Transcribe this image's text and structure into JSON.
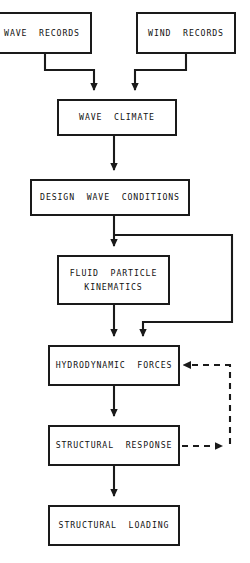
{
  "diagram": {
    "type": "flowchart",
    "colors": {
      "background": "#ffffff",
      "stroke": "#1a1a1a",
      "text": "#111111"
    },
    "nodes": [
      {
        "id": "wave-records",
        "label": "WAVE  RECORDS",
        "line1": "WAVE  RECORDS",
        "x": -8,
        "y": 12,
        "width": 100,
        "height": 42
      },
      {
        "id": "wind-records",
        "label": "WIND  RECORDS",
        "line1": "WIND  RECORDS",
        "x": 136,
        "y": 12,
        "width": 100,
        "height": 42
      },
      {
        "id": "wave-climate",
        "label": "WAVE  CLIMATE",
        "line1": "WAVE  CLIMATE",
        "x": 57,
        "y": 99,
        "width": 120,
        "height": 37
      },
      {
        "id": "design-wave-conditions",
        "label": "DESIGN  WAVE  CONDITIONS",
        "line1": "DESIGN  WAVE  CONDITIONS",
        "x": 30,
        "y": 179,
        "width": 160,
        "height": 37
      },
      {
        "id": "fluid-particle-kinematics",
        "label": "FLUID  PARTICLE KINEMATICS",
        "line1": "FLUID  PARTICLE",
        "line2": "KINEMATICS",
        "x": 57,
        "y": 255,
        "width": 113,
        "height": 50
      },
      {
        "id": "hydrodynamic-forces",
        "label": "HYDRODYNAMIC  FORCES",
        "line1": "HYDRODYNAMIC  FORCES",
        "x": 48,
        "y": 345,
        "width": 132,
        "height": 41
      },
      {
        "id": "structural-response",
        "label": "STRUCTURAL  RESPONSE",
        "line1": "STRUCTURAL  RESPONSE",
        "x": 48,
        "y": 425,
        "width": 132,
        "height": 41
      },
      {
        "id": "structural-loading",
        "label": "STRUCTURAL  LOADING",
        "line1": "STRUCTURAL  LOADING",
        "x": 48,
        "y": 505,
        "width": 132,
        "height": 41
      }
    ],
    "edges": [
      {
        "id": "wave-records-to-wave-climate",
        "from": "wave-records",
        "to": "wave-climate",
        "style": "solid",
        "arrow": "end"
      },
      {
        "id": "wind-records-to-wave-climate",
        "from": "wind-records",
        "to": "wave-climate",
        "style": "solid",
        "arrow": "end"
      },
      {
        "id": "wave-climate-to-design-wave-conditions",
        "from": "wave-climate",
        "to": "design-wave-conditions",
        "style": "solid",
        "arrow": "end"
      },
      {
        "id": "design-wave-conditions-to-fluid-particle-kinematics",
        "from": "design-wave-conditions",
        "to": "fluid-particle-kinematics",
        "style": "solid",
        "arrow": "end"
      },
      {
        "id": "design-wave-conditions-bypass-to-hydrodynamic-forces",
        "from": "design-wave-conditions",
        "to": "hydrodynamic-forces",
        "style": "solid",
        "arrow": "end"
      },
      {
        "id": "fluid-particle-kinematics-to-hydrodynamic-forces",
        "from": "fluid-particle-kinematics",
        "to": "hydrodynamic-forces",
        "style": "solid",
        "arrow": "end"
      },
      {
        "id": "hydrodynamic-forces-to-structural-response",
        "from": "hydrodynamic-forces",
        "to": "structural-response",
        "style": "solid",
        "arrow": "end"
      },
      {
        "id": "structural-response-to-structural-loading",
        "from": "structural-response",
        "to": "structural-loading",
        "style": "solid",
        "arrow": "end"
      },
      {
        "id": "structural-response-feedback-to-hydrodynamic-forces",
        "from": "structural-response",
        "to": "hydrodynamic-forces",
        "style": "dashed",
        "arrow": "both"
      }
    ]
  }
}
